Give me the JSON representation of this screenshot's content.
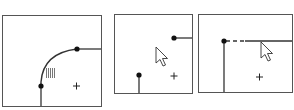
{
  "figure": {
    "line_color": "#333333",
    "border_color": "#555555",
    "hatch_color": "#777777",
    "panels": [
      {
        "id": "panel-1",
        "elements": [
          "vertical-segment",
          "rounded-corner-arc",
          "horizontal-segment",
          "start-node",
          "end-node",
          "hatched-handle",
          "crosshair"
        ]
      },
      {
        "id": "panel-2",
        "elements": [
          "vertical-stub",
          "horizontal-stub",
          "start-node",
          "end-node",
          "pointer-cursor",
          "crosshair"
        ]
      },
      {
        "id": "panel-3",
        "elements": [
          "vertical-segment",
          "dashed-preview-segment",
          "horizontal-segment",
          "corner-node",
          "pointer-cursor",
          "crosshair"
        ]
      }
    ]
  }
}
